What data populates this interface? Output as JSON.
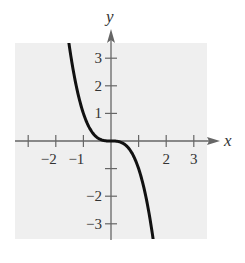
{
  "chart_data": {
    "type": "line",
    "title": "",
    "xlabel": "x",
    "ylabel": "y",
    "xlim": [
      -3.5,
      3.5
    ],
    "ylim": [
      -3.5,
      3.5
    ],
    "grid": false,
    "function": "y = -x^3",
    "x_ticks": [
      -3,
      -2,
      -1,
      1,
      2,
      3
    ],
    "y_ticks": [
      -3,
      -2,
      -1,
      1,
      2,
      3
    ],
    "x_tick_labels": [
      {
        "value": -2,
        "text": "−2"
      },
      {
        "value": -1,
        "text": "−1"
      },
      {
        "value": 2,
        "text": "2"
      },
      {
        "value": 3,
        "text": "3"
      }
    ],
    "y_tick_labels": [
      {
        "value": 3,
        "text": "3"
      },
      {
        "value": 2,
        "text": "2"
      },
      {
        "value": 1,
        "text": "1"
      },
      {
        "value": -2,
        "text": "−2"
      },
      {
        "value": -3,
        "text": "−3"
      }
    ],
    "series": [
      {
        "name": "y = -x^3",
        "x": [
          -1.55,
          -1.5,
          -1.25,
          -1.0,
          -0.75,
          -0.5,
          -0.25,
          0,
          0.25,
          0.5,
          0.75,
          1.0,
          1.25,
          1.5,
          1.55
        ],
        "values": [
          3.72,
          3.375,
          1.953,
          1.0,
          0.422,
          0.125,
          0.016,
          0,
          -0.016,
          -0.125,
          -0.422,
          -1.0,
          -1.953,
          -3.375,
          -3.72
        ]
      }
    ]
  },
  "axes": {
    "x_label": "x",
    "y_label": "y"
  },
  "colors": {
    "plot_background": "#efefef",
    "axis": "#666666",
    "curve": "#111111"
  }
}
